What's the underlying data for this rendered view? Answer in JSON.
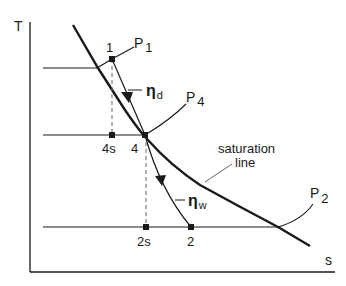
{
  "diagram": {
    "type": "T-s diagram",
    "axes": {
      "y_label": "T",
      "x_label": "s"
    },
    "labels": {
      "point_1": "1",
      "point_4s": "4s",
      "point_4": "4",
      "point_2s": "2s",
      "point_2": "2",
      "pressure_1": "P",
      "pressure_1_sub": "1",
      "pressure_4": "P",
      "pressure_4_sub": "4",
      "pressure_2": "P",
      "pressure_2_sub": "2",
      "eta_d": "η",
      "eta_d_sub": "d",
      "eta_w": "η",
      "eta_w_sub": "w",
      "saturation_line_1": "saturation",
      "saturation_line_2": "line"
    },
    "colors": {
      "line": "#1a1a1a",
      "background": "#ffffff"
    }
  }
}
